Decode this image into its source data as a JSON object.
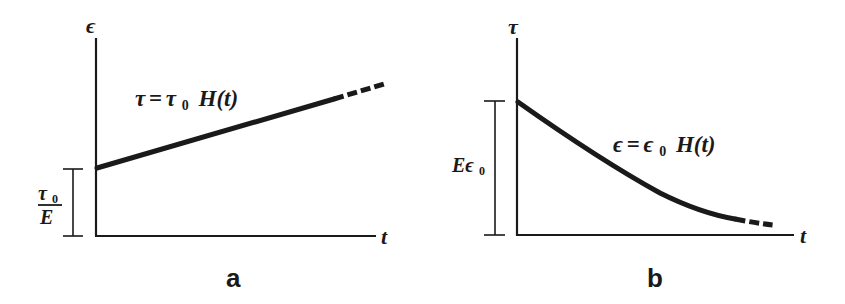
{
  "panels": [
    {
      "id": "a",
      "caption": "a",
      "y_axis_label": "ϵ",
      "x_axis_label": "t",
      "curve_label": {
        "lhs": "τ",
        "eq": "=",
        "rhs_sym": "τ",
        "rhs_sub": "0",
        "rhs_fn": "H(t)"
      },
      "bracket_label": {
        "numerator_sym": "τ",
        "numerator_sub": "0",
        "denominator": "E"
      },
      "curve_type": "linear-increasing (creep)"
    },
    {
      "id": "b",
      "caption": "b",
      "y_axis_label": "τ",
      "x_axis_label": "t",
      "curve_label": {
        "lhs": "ϵ",
        "eq": "=",
        "rhs_sym": "ϵ",
        "rhs_sub": "0",
        "rhs_fn": "H(t)"
      },
      "bracket_label": {
        "sym": "Eϵ",
        "sub": "0"
      },
      "curve_type": "decaying (stress relaxation)"
    }
  ],
  "colors": {
    "ink": "#1a1a1a",
    "background": "#ffffff"
  }
}
